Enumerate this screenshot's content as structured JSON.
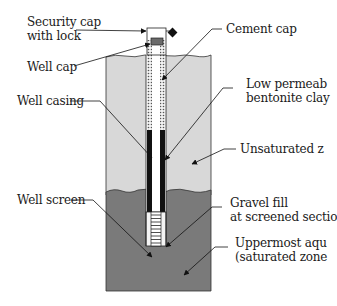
{
  "diagram": {
    "colors": {
      "unsaturated_zone": "#d8d8d8",
      "saturated_zone": "#7a7a7a",
      "casing": "#111111",
      "bentonite": "#f0f0f0",
      "well_cap": "#6a6a6a",
      "outline": "#222222"
    },
    "labels": {
      "security_cap": {
        "line1": "Security cap",
        "line2": "with lock"
      },
      "well_cap": "Well cap",
      "cement_cap": "Cement cap",
      "bentonite": {
        "line1": "Low permeab",
        "line2": "bentonite clay"
      },
      "well_casing": "Well casing",
      "unsaturated": "Unsaturated z",
      "well_screen": "Well screen",
      "gravel_fill": {
        "line1": "Gravel fill",
        "line2": "at screened sectio"
      },
      "aquifer": {
        "line1": "Uppermost aqu",
        "line2": "(saturated zone"
      }
    },
    "icons": {
      "lock": "lock-icon"
    }
  }
}
